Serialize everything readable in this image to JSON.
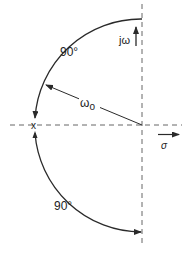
{
  "diagram": {
    "title": "",
    "labels": {
      "upper_angle": "90°",
      "lower_angle": "90°",
      "radius": "ω",
      "radius_subscript": "o",
      "imag_axis": "jω",
      "real_axis": "σ",
      "pole_marker": "x"
    },
    "geometry": {
      "origin": [
        142,
        125
      ],
      "radius": 108,
      "pole": [
        34,
        125
      ]
    },
    "colors": {
      "line": "#2a2a2a",
      "axis": "#666666",
      "background": "#ffffff"
    }
  }
}
